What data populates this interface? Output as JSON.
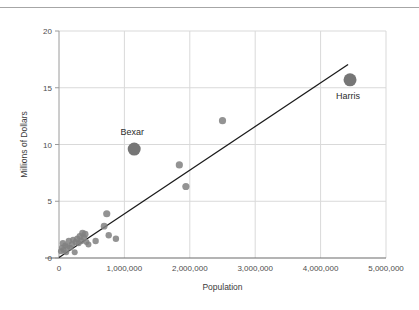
{
  "chart_data": {
    "type": "scatter",
    "title": "",
    "xlabel": "Population",
    "ylabel": "Millions of Dollars",
    "xlim": [
      0,
      5000000
    ],
    "ylim": [
      0,
      20
    ],
    "xticks": [
      0,
      1000000,
      2000000,
      3000000,
      4000000,
      5000000
    ],
    "xticklabels": [
      "0",
      "1,000,000",
      "2,000,000",
      "3,000,000",
      "4,000,000",
      "5,000,000"
    ],
    "yticks": [
      0,
      5,
      10,
      15,
      20
    ],
    "yticklabels": [
      "0",
      "5",
      "10",
      "15",
      "20"
    ],
    "grid": true,
    "grid_color": "#d9d9d9",
    "legend": false,
    "marker_color": "#808080",
    "highlight_color": "#767676",
    "trendline_color": "#1a1a1a",
    "series": [
      {
        "name": "Counties",
        "points": [
          {
            "x": 30000,
            "y": 0.6,
            "r": 3.0
          },
          {
            "x": 45000,
            "y": 0.9,
            "r": 3.0
          },
          {
            "x": 60000,
            "y": 1.3,
            "r": 3.2
          },
          {
            "x": 70000,
            "y": 0.7,
            "r": 3.0
          },
          {
            "x": 95000,
            "y": 1.1,
            "r": 3.0
          },
          {
            "x": 110000,
            "y": 0.5,
            "r": 3.0
          },
          {
            "x": 130000,
            "y": 1.0,
            "r": 3.0
          },
          {
            "x": 150000,
            "y": 1.5,
            "r": 3.2
          },
          {
            "x": 170000,
            "y": 0.9,
            "r": 3.0
          },
          {
            "x": 200000,
            "y": 1.2,
            "r": 3.2
          },
          {
            "x": 215000,
            "y": 1.6,
            "r": 3.0
          },
          {
            "x": 240000,
            "y": 0.5,
            "r": 3.0
          },
          {
            "x": 255000,
            "y": 1.4,
            "r": 3.2
          },
          {
            "x": 280000,
            "y": 1.7,
            "r": 3.2
          },
          {
            "x": 300000,
            "y": 1.3,
            "r": 3.0
          },
          {
            "x": 320000,
            "y": 1.9,
            "r": 3.4
          },
          {
            "x": 340000,
            "y": 1.5,
            "r": 3.2
          },
          {
            "x": 360000,
            "y": 2.2,
            "r": 3.4
          },
          {
            "x": 380000,
            "y": 1.8,
            "r": 3.2
          },
          {
            "x": 400000,
            "y": 2.1,
            "r": 3.4
          },
          {
            "x": 420000,
            "y": 1.4,
            "r": 3.0
          },
          {
            "x": 450000,
            "y": 1.2,
            "r": 3.0
          },
          {
            "x": 560000,
            "y": 1.5,
            "r": 3.2
          },
          {
            "x": 690000,
            "y": 2.8,
            "r": 3.4
          },
          {
            "x": 730000,
            "y": 3.9,
            "r": 3.6
          },
          {
            "x": 760000,
            "y": 2.0,
            "r": 3.2
          },
          {
            "x": 870000,
            "y": 1.7,
            "r": 3.2
          },
          {
            "x": 1840000,
            "y": 8.2,
            "r": 3.6
          },
          {
            "x": 1940000,
            "y": 6.3,
            "r": 3.6
          },
          {
            "x": 2500000,
            "y": 12.1,
            "r": 3.6
          }
        ]
      }
    ],
    "highlighted_points": [
      {
        "label": "Bexar",
        "x": 1150000,
        "y": 9.6,
        "r": 6.5,
        "label_dx": -2,
        "label_dy": -14
      },
      {
        "label": "Harris",
        "x": 4450000,
        "y": 15.7,
        "r": 6.5,
        "label_dx": -2,
        "label_dy": 19
      }
    ],
    "trendline": {
      "x_start": 0,
      "y_start": 0.05,
      "x_end": 4420000,
      "y_end": 17.05
    }
  }
}
